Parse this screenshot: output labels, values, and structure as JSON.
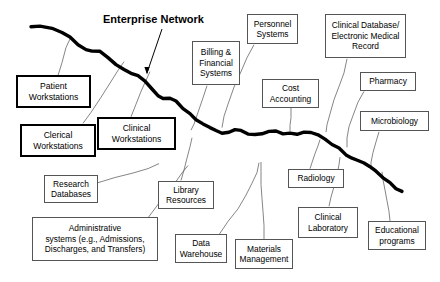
{
  "diagram": {
    "title": "Enterprise Network",
    "title_pos": {
      "x": 103,
      "y": 13
    },
    "backbone": {
      "label": "enterprise-network-backbone",
      "color": "#000000",
      "points": "31,27 40,26 52,28 62,32 70,38 78,44 86,50 92,52 100,52 108,57 116,64 124,70 131,74 138,76 145,81 152,88 158,95 163,98 170,98 176,102 183,108 190,114 196,119 203,123 210,127 216,131 222,133 229,132 235,130 241,131 248,133 255,134 262,133 269,132 276,132 283,133 290,134 297,134 304,133 311,133 318,135 325,139 332,144 339,149 346,154 352,158 358,161 364,163 370,166 376,171 383,177 390,183 396,188 402,191"
    },
    "annotation_arrow": {
      "label": "enterprise-network-pointer",
      "from": {
        "x": 162,
        "y": 29
      },
      "to": {
        "x": 147,
        "y": 73
      }
    },
    "nodes": [
      {
        "id": "patient-workstations",
        "label": "Patient\nWorkstations",
        "x": 16,
        "y": 75,
        "w": 75,
        "h": 33,
        "bold": true,
        "connector": "58,75 62,62 66,48 71,36"
      },
      {
        "id": "clerical-workstations",
        "label": "Clerical\nWorkstations",
        "x": 20,
        "y": 124,
        "w": 76,
        "h": 33,
        "bold": true,
        "connector": "83,124 91,112 101,98 110,84 118,70 124,62"
      },
      {
        "id": "clinical-workstations",
        "label": "Clinical\nWorkstations",
        "x": 97,
        "y": 117,
        "w": 79,
        "h": 33,
        "bold": true,
        "connector": "131,117 136,105 141,92 146,80 150,72"
      },
      {
        "id": "billing-financial-systems",
        "label": "Billing &\nFinancial\nSystems",
        "x": 192,
        "y": 41,
        "w": 48,
        "h": 44,
        "bold": false,
        "connector": "207,85 203,98 198,112 194,124 191,131"
      },
      {
        "id": "personnel-systems",
        "label": "Personnel\nSystems",
        "x": 247,
        "y": 14,
        "w": 51,
        "h": 30,
        "bold": false,
        "connector": "254,44 247,58 240,73 234,88 228,104 224,117 222,128"
      },
      {
        "id": "clinical-database-emr",
        "label": "Clinical Database/\nElectronic Medical\nRecord",
        "x": 325,
        "y": 14,
        "w": 81,
        "h": 44,
        "bold": false,
        "connector": "347,58 344,72 339,86 334,100 330,114 327,125 326,132"
      },
      {
        "id": "cost-accounting",
        "label": "Cost\nAccounting",
        "x": 262,
        "y": 79,
        "w": 57,
        "h": 29,
        "bold": false,
        "connector": "291,108 291,118 290,126 290,132"
      },
      {
        "id": "pharmacy",
        "label": "Pharmacy",
        "x": 360,
        "y": 72,
        "w": 56,
        "h": 19,
        "bold": false,
        "connector": "364,91 358,103 353,115 349,127 347,138 347,147"
      },
      {
        "id": "microbiology",
        "label": "Microbiology",
        "x": 360,
        "y": 111,
        "w": 69,
        "h": 20,
        "bold": false,
        "connector": "379,131 376,142 373,153 371,162 371,169"
      },
      {
        "id": "research-databases",
        "label": "Research\nDatabases",
        "x": 44,
        "y": 175,
        "w": 54,
        "h": 28,
        "bold": false,
        "connector": "98,183 115,178 132,173 148,168 159,164"
      },
      {
        "id": "administrative-systems",
        "label": "Administrative\nsystems (e.g., Admissions,\nDischarges, and Transfers)",
        "x": 32,
        "y": 217,
        "w": 126,
        "h": 44,
        "bold": false,
        "connector": "148,217 157,206 166,194 175,182 182,173 188,165"
      },
      {
        "id": "library-resources",
        "label": "Library\nResources",
        "x": 158,
        "y": 181,
        "w": 56,
        "h": 28,
        "bold": false,
        "connector": "181,181 184,170 187,158 190,147 192,138"
      },
      {
        "id": "data-warehouse",
        "label": "Data\nWarehouse",
        "x": 175,
        "y": 234,
        "w": 52,
        "h": 29,
        "bold": false,
        "connector": "219,234 228,222 238,208 246,195 252,183 257,172 259,163"
      },
      {
        "id": "materials-management",
        "label": "Materials\nManagement",
        "x": 235,
        "y": 239,
        "w": 58,
        "h": 30,
        "bold": false,
        "connector": "264,239 264,226 263,212 262,198 261,184 261,172 261,162"
      },
      {
        "id": "radiology",
        "label": "Radiology",
        "x": 288,
        "y": 169,
        "w": 56,
        "h": 19,
        "bold": false,
        "connector": "310,169 312,162 315,154 318,146 320,140"
      },
      {
        "id": "clinical-laboratory",
        "label": "Clinical\nLaboratory",
        "x": 298,
        "y": 207,
        "w": 60,
        "h": 31,
        "bold": false,
        "connector": "329,207 331,197 334,186 337,175 339,165 340,157"
      },
      {
        "id": "educational-programs",
        "label": "Educational\nprograms",
        "x": 368,
        "y": 221,
        "w": 58,
        "h": 29,
        "bold": false,
        "connector": "390,221 389,211 387,200 385,190 383,180 382,172"
      }
    ]
  }
}
